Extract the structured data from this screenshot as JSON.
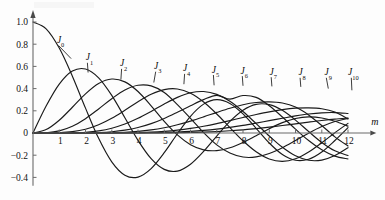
{
  "chart_data": {
    "type": "line",
    "title": "",
    "subtitle": "",
    "xlabel": "m",
    "ylabel": "",
    "xlim": [
      0,
      12.6
    ],
    "ylim": [
      -0.48,
      1.06
    ],
    "grid": false,
    "legend_position": "inline-curve-labels",
    "x_ticks": [
      "1",
      "2",
      "3",
      "4",
      "5",
      "6",
      "7",
      "8",
      "9",
      "10",
      "11",
      "12"
    ],
    "x_tick_values": [
      1,
      2,
      3,
      4,
      5,
      6,
      7,
      8,
      9,
      10,
      11,
      12
    ],
    "y_ticks": [
      "1.0",
      "0.8",
      "0.6",
      "0.4",
      "0.2",
      "0",
      "-0.2",
      "-0.4"
    ],
    "y_tick_values": [
      1.0,
      0.8,
      0.6,
      0.4,
      0.2,
      0,
      -0.2,
      -0.4
    ],
    "series": [
      {
        "name": "J0",
        "label": "J",
        "order": "0",
        "label_x": 1.05,
        "label_y": 0.81,
        "leader_to_x": 1.45,
        "leader_to_y": 0.67,
        "first_zero": 2.405,
        "first_min": -0.403,
        "values": [
          1.0,
          0.9385,
          0.7652,
          0.5118,
          0.2239,
          -0.0484,
          -0.2601,
          -0.3801,
          -0.3971,
          -0.3205,
          -0.1776,
          -0.0068,
          0.1506,
          0.2601,
          0.3001,
          0.2663,
          0.1717,
          0.0419,
          -0.0903,
          -0.1939,
          -0.2459,
          -0.2366,
          -0.1712,
          -0.0677,
          0.0477
        ]
      },
      {
        "name": "J1",
        "label": "J",
        "order": "1",
        "label_x": 2.15,
        "label_y": 0.655,
        "leader_to_x": 2.1,
        "leader_to_y": 0.545,
        "first_zero": 3.832,
        "first_max": 0.5819,
        "values": [
          0.0,
          0.2423,
          0.4401,
          0.5579,
          0.5767,
          0.4971,
          0.3391,
          0.1374,
          -0.066,
          -0.2311,
          -0.3276,
          -0.3432,
          -0.2811,
          -0.1655,
          -0.0271,
          0.1043,
          0.2051,
          0.2581,
          0.2559,
          0.2043,
          0.1164,
          0.0131,
          -0.0853,
          -0.1606,
          -0.2028
        ]
      },
      {
        "name": "J2",
        "label": "J",
        "order": "2",
        "label_x": 3.45,
        "label_y": 0.6,
        "leader_to_x": 3.35,
        "leader_to_y": 0.48,
        "first_zero": 5.136,
        "first_max": 0.4865,
        "values": [
          0.0,
          0.0306,
          0.1149,
          0.2321,
          0.3528,
          0.4461,
          0.4861,
          0.4605,
          0.3734,
          0.2453,
          0.1047,
          -0.0174,
          -0.1054,
          -0.152,
          -0.1584,
          -0.133,
          -0.0849,
          -0.0238,
          0.039,
          0.0935,
          0.1305,
          0.1448,
          0.1356,
          0.1058,
          0.0617
        ]
      },
      {
        "name": "J3",
        "label": "J",
        "order": "3",
        "label_x": 4.75,
        "label_y": 0.575,
        "leader_to_x": 4.6,
        "leader_to_y": 0.455,
        "first_zero": 6.38,
        "first_max": 0.4341,
        "values": [
          0.0,
          0.0026,
          0.0196,
          0.061,
          0.1289,
          0.2166,
          0.3091,
          0.3879,
          0.4302,
          0.4245,
          0.3648,
          0.2561,
          0.132,
          0.0033,
          -0.1068,
          -0.1809,
          -0.2167,
          -0.2157,
          -0.1846,
          -0.132,
          -0.0675,
          -0.0013,
          0.0578,
          0.1035,
          0.1316
        ]
      },
      {
        "name": "J4",
        "label": "J",
        "order": "4",
        "label_x": 5.85,
        "label_y": 0.555,
        "leader_to_x": 5.75,
        "leader_to_y": 0.44,
        "first_zero": 7.588,
        "first_max": 0.3991,
        "values": [
          0.0,
          0.0002,
          0.0025,
          0.0118,
          0.034,
          0.0737,
          0.132,
          0.2044,
          0.2811,
          0.3484,
          0.3912,
          0.3967,
          0.3576,
          0.2787,
          0.1711,
          0.0491,
          -0.0701,
          -0.1694,
          -0.2344,
          -0.2559,
          -0.232,
          -0.1711,
          -0.0876,
          0.0025,
          0.0869
        ]
      },
      {
        "name": "J5",
        "label": "J",
        "order": "5",
        "label_x": 6.95,
        "label_y": 0.545,
        "leader_to_x": 6.9,
        "leader_to_y": 0.43,
        "first_zero": 8.771,
        "first_max": 0.3741,
        "values": [
          0.0,
          0.0,
          0.0002,
          0.0018,
          0.007,
          0.0195,
          0.043,
          0.0804,
          0.1321,
          0.1947,
          0.2611,
          0.3209,
          0.3621,
          0.3734,
          0.3479,
          0.2855,
          0.1934,
          0.0849,
          -0.0271,
          -0.129,
          -0.2055,
          -0.2453,
          -0.2438,
          -0.2027,
          -0.1321
        ]
      },
      {
        "name": "J6",
        "label": "J",
        "order": "6",
        "label_x": 8.05,
        "label_y": 0.535,
        "leader_to_x": 8.0,
        "leader_to_y": 0.425,
        "first_zero": 9.936,
        "first_max": 0.3551,
        "values": [
          0.0,
          0.0,
          0.0,
          0.0002,
          0.0012,
          0.0043,
          0.0114,
          0.0254,
          0.0491,
          0.0843,
          0.131,
          0.1868,
          0.2458,
          0.3009,
          0.3392,
          0.3051,
          0.3376,
          0.3206,
          0.2458,
          0.1446,
          0.0345,
          -0.0682,
          -0.1518,
          -0.2085,
          -0.2337
        ]
      },
      {
        "name": "J7",
        "label": "J",
        "order": "7",
        "label_x": 9.15,
        "label_y": 0.525,
        "leader_to_x": 9.1,
        "leader_to_y": 0.42,
        "first_zero": 11.086,
        "first_max": 0.3392,
        "values": [
          0.0,
          0.0,
          0.0,
          0.0,
          0.0002,
          0.0008,
          0.0025,
          0.0064,
          0.0143,
          0.0277,
          0.0477,
          0.0745,
          0.1074,
          0.1453,
          0.1855,
          0.2235,
          0.2546,
          0.2743,
          0.28,
          0.27,
          0.2336,
          0.1628,
          0.067,
          -0.0346,
          -0.1173
        ]
      },
      {
        "name": "J8",
        "label": "J",
        "order": "8",
        "label_x": 10.25,
        "label_y": 0.52,
        "leader_to_x": 10.2,
        "leader_to_y": 0.415,
        "first_zero": 12.225,
        "first_max": 0.3261,
        "values": [
          0.0,
          0.0,
          0.0,
          0.0,
          0.0,
          0.0001,
          0.0005,
          0.0014,
          0.0037,
          0.0079,
          0.0152,
          0.0262,
          0.0415,
          0.0613,
          0.0849,
          0.1116,
          0.1395,
          0.1666,
          0.1909,
          0.2104,
          0.2235,
          0.2268,
          0.2184,
          0.1885,
          0.1263
        ]
      },
      {
        "name": "J9",
        "label": "J",
        "order": "9",
        "label_x": 11.25,
        "label_y": 0.52,
        "leader_to_x": 11.25,
        "leader_to_y": 0.4,
        "first_max": 0.3152,
        "values": [
          0.0,
          0.0,
          0.0,
          0.0,
          0.0,
          0.0,
          0.0001,
          0.0003,
          0.0008,
          0.0021,
          0.0043,
          0.0083,
          0.0145,
          0.0235,
          0.0355,
          0.0508,
          0.0688,
          0.0894,
          0.111,
          0.1328,
          0.1537,
          0.1708,
          0.1818,
          0.1839,
          0.1758
        ]
      },
      {
        "name": "J10",
        "label": "J",
        "order": "10",
        "label_x": 12.2,
        "label_y": 0.52,
        "leader_to_x": 12.15,
        "leader_to_y": 0.385,
        "first_max": 0.3059,
        "values": [
          0.0,
          0.0,
          0.0,
          0.0,
          0.0,
          0.0,
          0.0,
          0.0001,
          0.0002,
          0.0005,
          0.0012,
          0.0024,
          0.0046,
          0.008,
          0.013,
          0.0198,
          0.0287,
          0.0398,
          0.0527,
          0.0672,
          0.0825,
          0.0981,
          0.1128,
          0.1252,
          0.1344
        ]
      }
    ],
    "x_start": 0,
    "x_step": 0.5,
    "colors": {
      "curve": "#1a1a1a",
      "axis": "#6b6b6b",
      "text": "#111111",
      "background": "#fdfdfd"
    }
  }
}
